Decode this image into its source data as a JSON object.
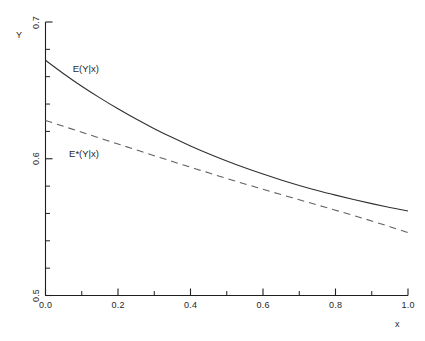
{
  "chart_data": {
    "type": "line",
    "title": "",
    "subtitle": "",
    "xlabel": "x",
    "ylabel": "Y",
    "xlim": [
      0.0,
      1.0
    ],
    "ylim": [
      0.5,
      0.7
    ],
    "grid": false,
    "legend_position": "inline-annotations",
    "x_ticks": [
      "0.0",
      "0.2",
      "0.4",
      "0.6",
      "0.8",
      "1.0"
    ],
    "x_tick_values": [
      0.0,
      0.2,
      0.4,
      0.6,
      0.8,
      1.0
    ],
    "x_minor_tick_values": [
      0.1,
      0.3,
      0.5,
      0.7,
      0.9
    ],
    "y_ticks": [
      "0.7",
      "0.6",
      "0.5"
    ],
    "y_tick_values": [
      0.7,
      0.6,
      0.5
    ],
    "y_minor_tick_values": [
      0.52,
      0.54,
      0.56,
      0.58,
      0.62,
      0.64,
      0.66,
      0.68
    ],
    "x": [
      0.0,
      0.05,
      0.1,
      0.15,
      0.2,
      0.25,
      0.3,
      0.35,
      0.4,
      0.45,
      0.5,
      0.55,
      0.6,
      0.65,
      0.7,
      0.75,
      0.8,
      0.85,
      0.9,
      0.95,
      1.0
    ],
    "series": [
      {
        "name": "E(Y|x)",
        "style": "solid",
        "color": "#303030",
        "label_x": 0.075,
        "label_y": 0.6655,
        "values": [
          0.672,
          0.6622,
          0.653,
          0.6445,
          0.6365,
          0.629,
          0.622,
          0.6155,
          0.6094,
          0.6037,
          0.5984,
          0.5934,
          0.5888,
          0.5845,
          0.5805,
          0.5768,
          0.5734,
          0.5702,
          0.5672,
          0.5644,
          0.5618
        ]
      },
      {
        "name": "E*(Y|x)",
        "style": "dashed",
        "color": "#606060",
        "label_x": 0.065,
        "label_y": 0.6035,
        "values": [
          0.628,
          0.6237,
          0.6194,
          0.6151,
          0.6108,
          0.6065,
          0.6022,
          0.598,
          0.5938,
          0.5897,
          0.5856,
          0.5816,
          0.5777,
          0.5738,
          0.57,
          0.5662,
          0.5624,
          0.5585,
          0.5545,
          0.5503,
          0.546
        ]
      }
    ],
    "annotations": [
      {
        "text": "E(Y|x)",
        "x": 0.075,
        "y": 0.6655
      },
      {
        "text": "E*(Y|x)",
        "x": 0.065,
        "y": 0.6035
      }
    ]
  },
  "axes": {
    "y_axis_title": "Y",
    "x_axis_title": "x",
    "y_labels": [
      "0.7",
      "0.6",
      "0.5"
    ],
    "x_labels": [
      "0.0",
      "0.2",
      "0.4",
      "0.6",
      "0.8",
      "1.0"
    ]
  },
  "style": {
    "background": "#ffffff",
    "axis_color": "#1f1f1f",
    "solid_curve_color": "#303030",
    "dashed_curve_color": "#606060"
  }
}
